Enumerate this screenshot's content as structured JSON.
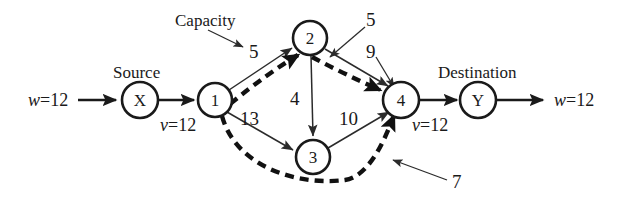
{
  "diagram": {
    "annotations": {
      "capacity_label": "Capacity",
      "source_label": "Source",
      "destination_label": "Destination"
    },
    "nodes": [
      {
        "id": "X",
        "label": "X",
        "cx": 140,
        "cy": 100,
        "r": 18
      },
      {
        "id": "1",
        "label": "1",
        "cx": 215,
        "cy": 100,
        "r": 17
      },
      {
        "id": "2",
        "label": "2",
        "cx": 310,
        "cy": 38,
        "r": 17
      },
      {
        "id": "3",
        "label": "3",
        "cx": 313,
        "cy": 157,
        "r": 17
      },
      {
        "id": "4",
        "label": "4",
        "cx": 401,
        "cy": 100,
        "r": 18
      },
      {
        "id": "Y",
        "label": "Y",
        "cx": 478,
        "cy": 100,
        "r": 18
      }
    ],
    "edge_labels": {
      "e1_2": "5",
      "e2_4_pointer": "5",
      "e2_4": "9",
      "e2_3": "4",
      "e1_3": "13",
      "e3_4": "10",
      "e_lower_flow": "7"
    },
    "flow_values": {
      "inflow": "w=12",
      "inflow_w": "w",
      "inflow_eq": "=12",
      "source_flow": "v=12",
      "source_flow_v": "v",
      "source_flow_eq": "=12",
      "dest_flow": "v=12",
      "dest_flow_v": "v",
      "dest_flow_eq": "=12",
      "outflow": "w=12",
      "outflow_w": "w",
      "outflow_eq": "=12"
    },
    "colors": {
      "stroke": "#1a1a1a",
      "thin_stroke": "#2b2b2b",
      "background": "#ffffff"
    }
  }
}
